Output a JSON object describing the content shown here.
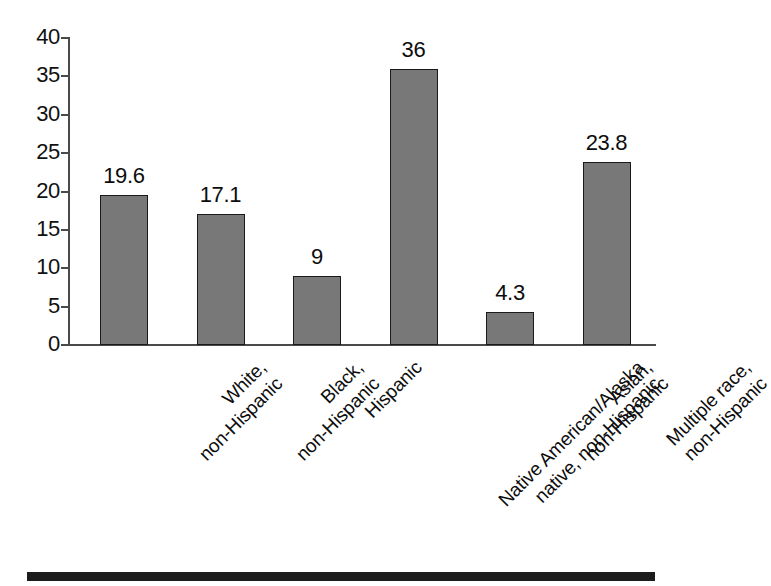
{
  "chart_data": {
    "type": "bar",
    "title": "",
    "subtitle": "",
    "xlabel": "",
    "ylabel": "",
    "ylim": [
      0,
      40
    ],
    "y_ticks": [
      0,
      5,
      10,
      15,
      20,
      25,
      30,
      35,
      40
    ],
    "y_tick_labels": [
      "0",
      "5",
      "10",
      "15",
      "20",
      "25",
      "30",
      "35",
      "40"
    ],
    "grid": false,
    "legend": "none",
    "categories": [
      "White, non-Hispanic",
      "Black, non-Hispanic",
      "Hispanic",
      "Native American/Alaska native, non-Hispanic",
      "Asian, non-Hispanic",
      "Multiple race, non-Hispanic"
    ],
    "category_lines": [
      [
        "White,",
        "non-Hispanic"
      ],
      [
        "Black,",
        "non-Hispanic"
      ],
      [
        "Hispanic"
      ],
      [
        "Native American/Alaska",
        "native, non-Hispanic"
      ],
      [
        "Asian,",
        "non-Hispanic"
      ],
      [
        "Multiple race,",
        "non-Hispanic"
      ]
    ],
    "values": [
      19.6,
      17.1,
      9,
      36,
      4.3,
      23.8
    ],
    "value_labels": [
      "19.6",
      "17.1",
      "9",
      "36",
      "4.3",
      "23.8"
    ],
    "bar_color": "#787878",
    "bar_edge_color": "#1a1a1a",
    "axis_color": "#4a4a4a",
    "text_color": "#0d0d0d",
    "background_color": "#ffffff"
  },
  "artifacts": {
    "page_rule_color": "#1c1c1c"
  }
}
